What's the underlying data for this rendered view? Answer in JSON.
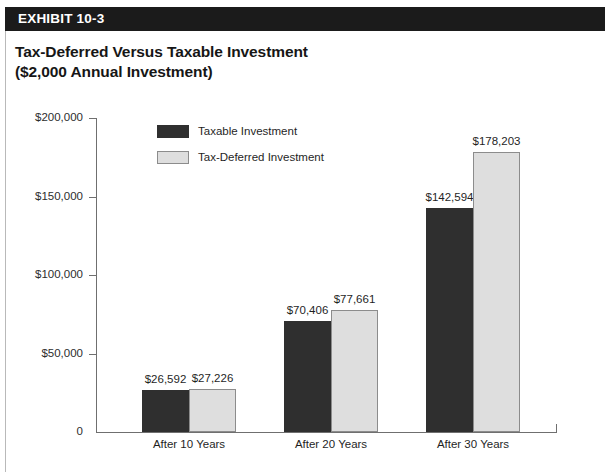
{
  "exhibit": {
    "band_label": "EXHIBIT 10-3"
  },
  "title": {
    "line1": "Tax-Deferred Versus Taxable Investment",
    "line2": "($2,000 Annual Investment)"
  },
  "footnote": {
    "text": ""
  },
  "colors": {
    "taxable": "#2f2f2f",
    "tax_deferred": "#dedede",
    "tax_deferred_border": "#8c8c8c",
    "band": "#1b1b1b",
    "axis": "#6f6f6f"
  },
  "chart_data": {
    "type": "bar",
    "title": "Tax-Deferred Versus Taxable Investment ($2,000 Annual Investment)",
    "xlabel": "",
    "ylabel": "",
    "ylim": [
      0,
      200000
    ],
    "grid": false,
    "legend_position": "top-left-inside",
    "ytick_labels": [
      "$200,000",
      "$150,000",
      "$100,000",
      "$50,000",
      "0"
    ],
    "ytick_values": [
      200000,
      150000,
      100000,
      50000,
      0
    ],
    "categories": [
      "After 10 Years",
      "After 20 Years",
      "After 30 Years"
    ],
    "series": [
      {
        "name": "Taxable Investment",
        "color": "#2f2f2f",
        "values": [
          26592,
          70406,
          142594
        ],
        "labels": [
          "$26,592",
          "$70,406",
          "$142,594"
        ]
      },
      {
        "name": "Tax-Deferred Investment",
        "color": "#dedede",
        "values": [
          27226,
          77661,
          178203
        ],
        "labels": [
          "$27,226",
          "$77,661",
          "$178,203"
        ]
      }
    ]
  }
}
